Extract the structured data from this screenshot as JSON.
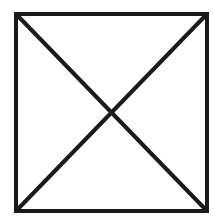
{
  "diagram": {
    "type": "square-with-diagonals",
    "canvas": {
      "width": 213,
      "height": 217
    },
    "background": "#ffffff",
    "stroke_color": "#1a1a1a",
    "stroke_width": 4,
    "square": {
      "x1": 16,
      "y1": 14,
      "x2": 207,
      "y2": 211
    },
    "diagonals": [
      {
        "name": "top-left-to-bottom-right",
        "from": [
          16,
          14
        ],
        "to": [
          207,
          211
        ]
      },
      {
        "name": "top-right-to-bottom-left",
        "from": [
          207,
          14
        ],
        "to": [
          16,
          211
        ]
      }
    ]
  }
}
